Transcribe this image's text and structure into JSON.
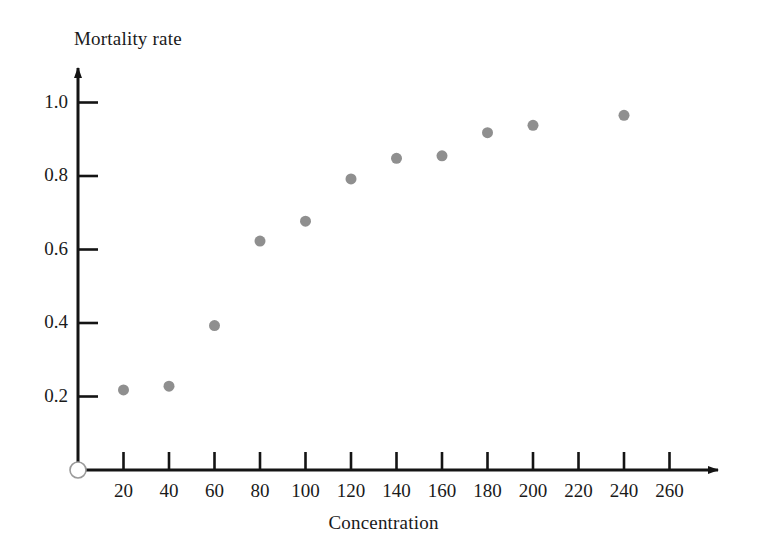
{
  "chart_data": {
    "type": "scatter",
    "title": "",
    "xlabel": "Concentration",
    "ylabel": "Mortality rate",
    "xlim": [
      0,
      270
    ],
    "ylim": [
      0,
      1.08
    ],
    "grid": false,
    "legend": null,
    "x_ticks": [
      20,
      40,
      60,
      80,
      100,
      120,
      140,
      160,
      180,
      200,
      220,
      240,
      260
    ],
    "x_tick_labels": [
      "20",
      "40",
      "60",
      "80",
      "100",
      "120",
      "140",
      "160",
      "180",
      "200",
      "220",
      "240",
      "260"
    ],
    "y_ticks": [
      0.2,
      0.4,
      0.6,
      0.8,
      1.0
    ],
    "y_tick_labels": [
      "0.2",
      "0.4",
      "0.6",
      "0.8",
      "1.0"
    ],
    "origin_marker": "open-circle",
    "marker": {
      "shape": "circle",
      "color": "#8f8f8f",
      "size": 11
    },
    "axis_color": "#141414",
    "x": [
      20,
      40,
      60,
      80,
      100,
      120,
      140,
      160,
      180,
      200,
      240
    ],
    "y": [
      0.218,
      0.228,
      0.393,
      0.623,
      0.677,
      0.792,
      0.848,
      0.855,
      0.918,
      0.938,
      0.965
    ],
    "points": [
      {
        "x": 20,
        "y": 0.218
      },
      {
        "x": 40,
        "y": 0.228
      },
      {
        "x": 60,
        "y": 0.393
      },
      {
        "x": 80,
        "y": 0.623
      },
      {
        "x": 100,
        "y": 0.677
      },
      {
        "x": 120,
        "y": 0.792
      },
      {
        "x": 140,
        "y": 0.848
      },
      {
        "x": 160,
        "y": 0.855
      },
      {
        "x": 180,
        "y": 0.918
      },
      {
        "x": 200,
        "y": 0.938
      },
      {
        "x": 240,
        "y": 0.965
      }
    ]
  }
}
